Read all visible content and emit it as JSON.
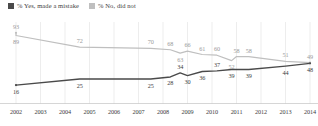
{
  "legend": {
    "entries": [
      {
        "label": "% Yes, made a mistake",
        "color": "#4a4a4a",
        "key": "yes"
      },
      {
        "label": "% No, did not",
        "color": "#bfbfbf",
        "key": "no"
      }
    ]
  },
  "chart_data": {
    "type": "line",
    "title": "",
    "subtitle": "",
    "xlabel": "",
    "ylabel": "",
    "grid": "vertical",
    "legend_position": "top-left",
    "xlim": [
      2002,
      2014
    ],
    "ylim": [
      0,
      100
    ],
    "categories": [
      2002,
      2003,
      2004,
      2005,
      2006,
      2007,
      2008,
      2009,
      2010,
      2011,
      2012,
      2013,
      2014
    ],
    "x_tick_labels": [
      "2002",
      "2003",
      "2004",
      "2005",
      "2006",
      "2007",
      "2008",
      "2009",
      "2010",
      "2011",
      "2012",
      "2013",
      "2014"
    ],
    "series": [
      {
        "name": "% No, did not",
        "color": "#bfbfbf",
        "points": [
          {
            "x": 2002.0,
            "y": 93,
            "label": "93",
            "label_pos": "above"
          },
          {
            "x": 2002.0,
            "y": 89,
            "label": "89",
            "label_pos": "below"
          },
          {
            "x": 2004.6,
            "y": 72,
            "label": "72",
            "label_pos": "above"
          },
          {
            "x": 2007.5,
            "y": 70,
            "label": "70",
            "label_pos": "above"
          },
          {
            "x": 2008.3,
            "y": 68,
            "label": "68",
            "label_pos": "above"
          },
          {
            "x": 2008.7,
            "y": 63,
            "label": "63",
            "label_pos": "below"
          },
          {
            "x": 2009.0,
            "y": 66,
            "label": "66",
            "label_pos": "above"
          },
          {
            "x": 2009.6,
            "y": 61,
            "label": "61",
            "label_pos": "above"
          },
          {
            "x": 2010.2,
            "y": 60,
            "label": "60",
            "label_pos": "above"
          },
          {
            "x": 2010.8,
            "y": 52,
            "label": "52",
            "label_pos": "below"
          },
          {
            "x": 2011.0,
            "y": 58,
            "label": "58",
            "label_pos": "above"
          },
          {
            "x": 2011.5,
            "y": 58,
            "label": "58",
            "label_pos": "above"
          },
          {
            "x": 2013.0,
            "y": 51,
            "label": "51",
            "label_pos": "above"
          },
          {
            "x": 2014.0,
            "y": 49,
            "label": "49",
            "label_pos": "above"
          }
        ]
      },
      {
        "name": "% Yes, made a mistake",
        "color": "#4a4a4a",
        "points": [
          {
            "x": 2002.0,
            "y": 16,
            "label": "16",
            "label_pos": "below"
          },
          {
            "x": 2004.6,
            "y": 25,
            "label": "25",
            "label_pos": "below"
          },
          {
            "x": 2007.5,
            "y": 25,
            "label": "25",
            "label_pos": "below"
          },
          {
            "x": 2008.3,
            "y": 28,
            "label": "28",
            "label_pos": "below"
          },
          {
            "x": 2008.7,
            "y": 34,
            "label": "34",
            "label_pos": "above"
          },
          {
            "x": 2009.0,
            "y": 30,
            "label": "30",
            "label_pos": "below"
          },
          {
            "x": 2009.6,
            "y": 36,
            "label": "36",
            "label_pos": "below"
          },
          {
            "x": 2010.2,
            "y": 37,
            "label": "37",
            "label_pos": "above"
          },
          {
            "x": 2010.8,
            "y": 39,
            "label": "39",
            "label_pos": "below"
          },
          {
            "x": 2011.5,
            "y": 39,
            "label": "39",
            "label_pos": "below"
          },
          {
            "x": 2013.0,
            "y": 44,
            "label": "44",
            "label_pos": "below"
          },
          {
            "x": 2014.0,
            "y": 48,
            "label": "48",
            "label_pos": "below"
          }
        ]
      }
    ]
  }
}
